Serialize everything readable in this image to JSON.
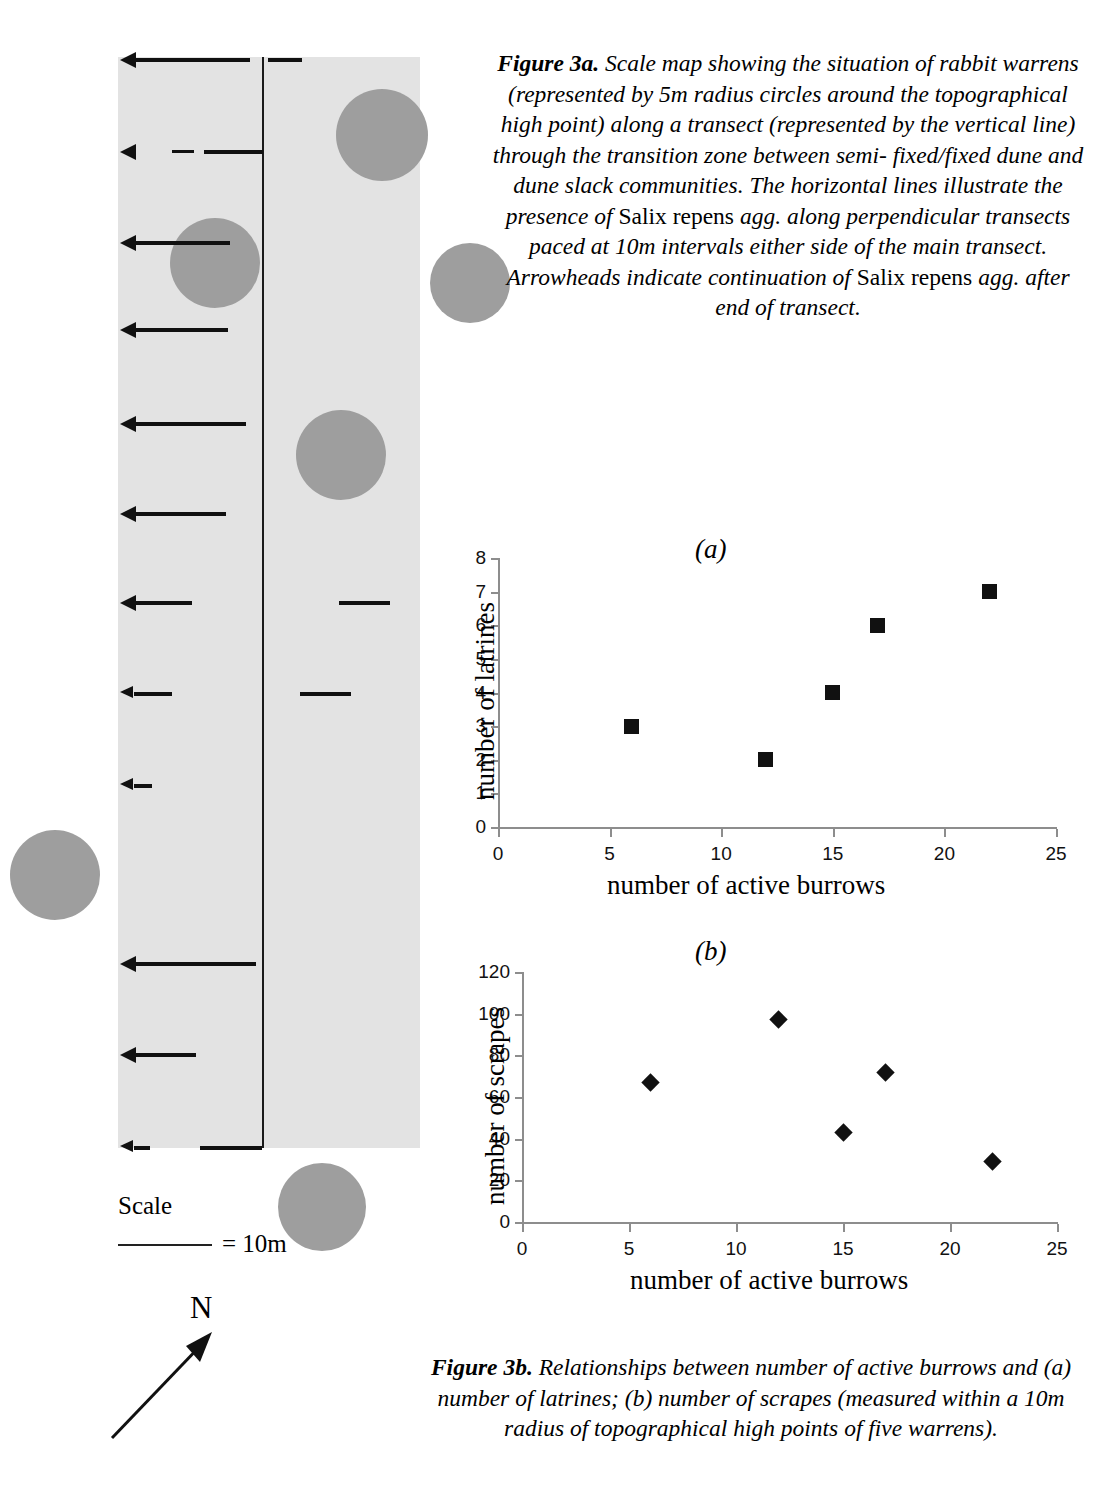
{
  "map": {
    "title": "scale-map-of-rabbit-warrens",
    "band_color": "#e3e3e3",
    "warren_color": "#9e9e9e",
    "legend": {
      "scale_label": "Scale",
      "scale_value": "= 10m",
      "north_label": "N"
    },
    "warrens": [
      {
        "cx": 382,
        "cy": 135,
        "r": 46
      },
      {
        "cx": 215,
        "cy": 263,
        "r": 45
      },
      {
        "cx": 470,
        "cy": 283,
        "r": 40
      },
      {
        "cx": 341,
        "cy": 455,
        "r": 45
      },
      {
        "cx": 55,
        "cy": 875,
        "r": 45
      },
      {
        "cx": 322,
        "cy": 1207,
        "r": 44
      }
    ],
    "transect_rows": [
      {
        "y": 60,
        "left_end": 250,
        "right_start": 268,
        "right_end": 302
      },
      {
        "y": 152,
        "left_end": 263,
        "dash": true
      },
      {
        "y": 243,
        "left_end": 230
      },
      {
        "y": 330,
        "left_end": 228
      },
      {
        "y": 424,
        "left_end": 246
      },
      {
        "y": 514,
        "left_end": 226
      },
      {
        "y": 603,
        "left_end": 192,
        "right_start": 339,
        "right_end": 390
      },
      {
        "y": 694,
        "left_end": 172,
        "right_start": 300,
        "right_end": 351
      },
      {
        "y": 786,
        "left_end": 152
      },
      {
        "y": 964,
        "left_end": 256
      },
      {
        "y": 1055,
        "left_end": 196
      },
      {
        "y": 1148,
        "left_end": 150,
        "right_start": 200,
        "right_end": 262
      }
    ]
  },
  "figure_3a_caption": {
    "label": "Figure 3a.",
    "line1": "Scale map showing the situation of",
    "line2": "rabbit warrens (represented by 5m radius circles",
    "line3": "around the topographical high point) along a",
    "line4": "transect (represented by the vertical line)",
    "line5": "through the transition zone between semi-",
    "line6": "fixed/fixed dune and dune slack communities.",
    "line7": "The horizontal lines illustrate the presence of",
    "line8_roman": "Salix repens",
    "line8_italic": "agg. along perpendicular transects",
    "line9": "paced at 10m intervals either side of the main",
    "line10": "transect. Arrowheads indicate continuation of",
    "line11_roman": "Salix repens",
    "line11_italic": "agg. after end of transect."
  },
  "figure_3b_caption": {
    "label": "Figure 3b.",
    "line1": "Relationships between number of active",
    "line2": "burrows and (a) number of latrines; (b) number of scrapes",
    "line3": "(measured within a 10m radius of topographical high",
    "line4": "points of five warrens)."
  },
  "chart_data": [
    {
      "type": "scatter",
      "panel": "(a)",
      "title": "",
      "xlabel": "number of active burrows",
      "ylabel": "number of latrines",
      "x": [
        6,
        12,
        15,
        17,
        22
      ],
      "values": [
        3,
        2,
        4,
        6,
        7
      ],
      "xlim": [
        0,
        25
      ],
      "ylim": [
        0,
        8
      ],
      "xticks": [
        0,
        5,
        10,
        15,
        20,
        25
      ],
      "yticks": [
        0,
        1,
        2,
        3,
        4,
        5,
        6,
        7,
        8
      ],
      "marker": "square",
      "grid": false,
      "legend": "none"
    },
    {
      "type": "scatter",
      "panel": "(b)",
      "title": "",
      "xlabel": "number of active burrows",
      "ylabel": "number of scrapes",
      "x": [
        6,
        12,
        15,
        17,
        22
      ],
      "values": [
        67,
        97,
        43,
        72,
        29
      ],
      "xlim": [
        0,
        25
      ],
      "ylim": [
        0,
        120
      ],
      "xticks": [
        0,
        5,
        10,
        15,
        20,
        25
      ],
      "yticks": [
        0,
        20,
        40,
        60,
        80,
        100,
        120
      ],
      "marker": "diamond",
      "grid": false,
      "legend": "none"
    }
  ]
}
